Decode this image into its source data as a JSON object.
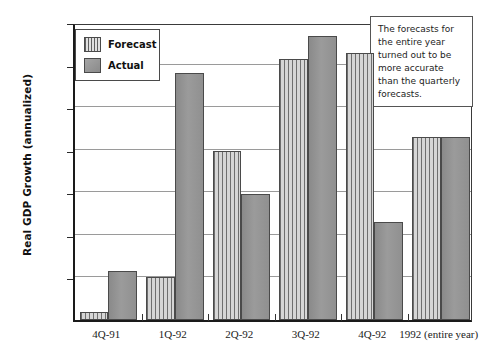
{
  "chart_data": {
    "type": "bar",
    "title": "",
    "xlabel": "",
    "ylabel": "Real GDP Growth (annualized)",
    "ylim": [
      0,
      3.5
    ],
    "ytick_values": [
      0.0,
      0.5,
      1.0,
      1.5,
      2.0,
      2.5,
      3.0,
      3.5
    ],
    "ytick_labels": [
      "0.00%",
      "0.50%",
      "1.00%",
      "1.50%",
      "2.00%",
      "2.50%",
      "3.00%",
      "3.50%"
    ],
    "grid": true,
    "legend_position": "upper-left-inside",
    "categories": [
      "4Q-91",
      "1Q-92",
      "2Q-92",
      "3Q-92",
      "4Q-92",
      "1992 (entire year)"
    ],
    "series": [
      {
        "name": "Forecast",
        "fill": "vertical-stripes",
        "color": "#b9b9b9",
        "values": [
          0.1,
          0.5,
          1.98,
          3.07,
          3.14,
          2.15
        ]
      },
      {
        "name": "Actual",
        "fill": "solid",
        "color": "#8f8f8f",
        "values": [
          0.58,
          2.9,
          1.48,
          3.33,
          1.15,
          2.15
        ]
      }
    ],
    "annotations": [
      {
        "name": "forecast-accuracy-note",
        "text": "The forecasts for the entire year turned out to be more accurate than the quarterly forecasts."
      }
    ]
  },
  "legend": {
    "items": [
      {
        "label": "Forecast"
      },
      {
        "label": "Actual"
      }
    ]
  },
  "colors": {
    "forecast": "#b9b9b9",
    "actual": "#8f8f8f",
    "axis": "#1a1a1a",
    "grid": "#9a9a9a"
  }
}
